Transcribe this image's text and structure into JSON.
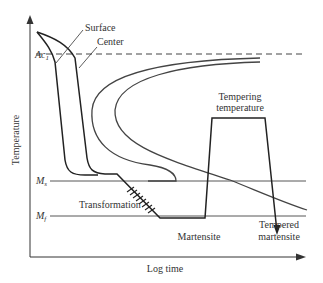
{
  "diagram": {
    "title": "",
    "axes": {
      "x_label": "Log time",
      "y_label": "Temperature"
    },
    "levels": {
      "ac1": "Ac",
      "ac1_sub": "1",
      "ms": "M",
      "ms_sub": "s",
      "mf": "M",
      "mf_sub": "f"
    },
    "labels": {
      "surface": "Surface",
      "center": "Center",
      "tempering_line1": "Tempering",
      "tempering_line2": "temperature",
      "transformation": "Transformation",
      "martensite": "Martensite",
      "tempered_line1": "Tempered",
      "tempered_line2": "martensite"
    },
    "colors": {
      "line": "#222222",
      "curve": "#444444",
      "text": "#333333"
    }
  }
}
